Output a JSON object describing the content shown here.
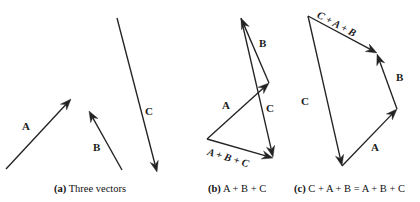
{
  "figure": {
    "width": 420,
    "height": 202,
    "background_color": "#ffffff",
    "line_color": "#232323"
  },
  "panels": [
    {
      "id": "a",
      "caption_tag": "(a)",
      "caption_text": "Three vectors",
      "caption_x": 54,
      "caption_y": 184,
      "vectors": [
        {
          "name": "A",
          "label": "A",
          "x1": 6,
          "y1": 169,
          "x2": 71,
          "y2": 99,
          "label_x": 22,
          "label_y": 121
        },
        {
          "name": "B",
          "label": "B",
          "x1": 122,
          "y1": 170,
          "x2": 89,
          "y2": 111,
          "label_x": 93,
          "label_y": 142
        },
        {
          "name": "C",
          "label": "C",
          "x1": 117,
          "y1": 18,
          "x2": 157,
          "y2": 172,
          "label_x": 145,
          "label_y": 106
        }
      ],
      "sum_labels": []
    },
    {
      "id": "b",
      "caption_tag": "(b)",
      "caption_text": "A + B + C",
      "caption_x": 208,
      "caption_y": 184,
      "vectors": [
        {
          "name": "A",
          "label": "A",
          "x1": 207,
          "y1": 139,
          "x2": 269,
          "y2": 83,
          "label_x": 222,
          "label_y": 100
        },
        {
          "name": "B",
          "label": "B",
          "x1": 269,
          "y1": 83,
          "x2": 241,
          "y2": 18,
          "label_x": 259,
          "label_y": 38
        },
        {
          "name": "C",
          "label": "C",
          "x1": 241,
          "y1": 18,
          "x2": 273,
          "y2": 157,
          "label_x": 266,
          "label_y": 103
        },
        {
          "name": "resultant",
          "label": "",
          "x1": 207,
          "y1": 139,
          "x2": 273,
          "y2": 158,
          "label_x": 0,
          "label_y": 0
        }
      ],
      "sum_labels": [
        {
          "name": "a-plus-b-plus-c",
          "text": "A + B + C",
          "x": 209,
          "y": 147,
          "rotate": 17
        }
      ]
    },
    {
      "id": "c",
      "caption_tag": "(c)",
      "caption_text": "C + A + B = A + B + C",
      "caption_x": 294,
      "caption_y": 184,
      "vectors": [
        {
          "name": "C",
          "label": "C",
          "x1": 308,
          "y1": 16,
          "x2": 342,
          "y2": 166,
          "label_x": 301,
          "label_y": 96
        },
        {
          "name": "A",
          "label": "A",
          "x1": 342,
          "y1": 166,
          "x2": 397,
          "y2": 109,
          "label_x": 371,
          "label_y": 142
        },
        {
          "name": "B",
          "label": "B",
          "x1": 397,
          "y1": 109,
          "x2": 377,
          "y2": 54,
          "label_x": 396,
          "label_y": 72
        },
        {
          "name": "resultant",
          "label": "",
          "x1": 308,
          "y1": 16,
          "x2": 377,
          "y2": 53,
          "label_x": 0,
          "label_y": 0
        }
      ],
      "sum_labels": [
        {
          "name": "c-plus-a-plus-b",
          "text": "C + A + B",
          "x": 320,
          "y": 10,
          "rotate": 28
        }
      ]
    }
  ]
}
